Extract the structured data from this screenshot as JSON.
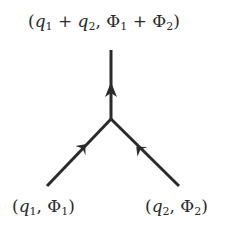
{
  "diagram": {
    "type": "feynman-vertex",
    "line_color": "#2b2b2b",
    "vertex": {
      "x": 111,
      "y": 118
    },
    "lines": [
      {
        "id": "incoming-left",
        "from": [
          47,
          186
        ],
        "to": [
          111,
          118
        ],
        "arrow": "toward-vertex"
      },
      {
        "id": "incoming-right",
        "from": [
          179,
          186
        ],
        "to": [
          111,
          118
        ],
        "arrow": "toward-vertex"
      },
      {
        "id": "outgoing-top",
        "from": [
          111,
          118
        ],
        "to": [
          111,
          50
        ],
        "arrow": "away-from-vertex"
      }
    ],
    "labels": {
      "top": {
        "open": "(",
        "q1": "q",
        "q1_sub": "1",
        "plus1": " + ",
        "q2": "q",
        "q2_sub": "2",
        "comma": ", ",
        "phi1": "Φ",
        "phi1_sub": "1",
        "plus2": " + ",
        "phi2": "Φ",
        "phi2_sub": "2",
        "close": ")"
      },
      "left": {
        "open": "(",
        "q": "q",
        "q_sub": "1",
        "comma": ", ",
        "phi": "Φ",
        "phi_sub": "1",
        "close": ")"
      },
      "right": {
        "open": "(",
        "q": "q",
        "q_sub": "2",
        "comma": ", ",
        "phi": "Φ",
        "phi_sub": "2",
        "close": ")"
      }
    }
  }
}
